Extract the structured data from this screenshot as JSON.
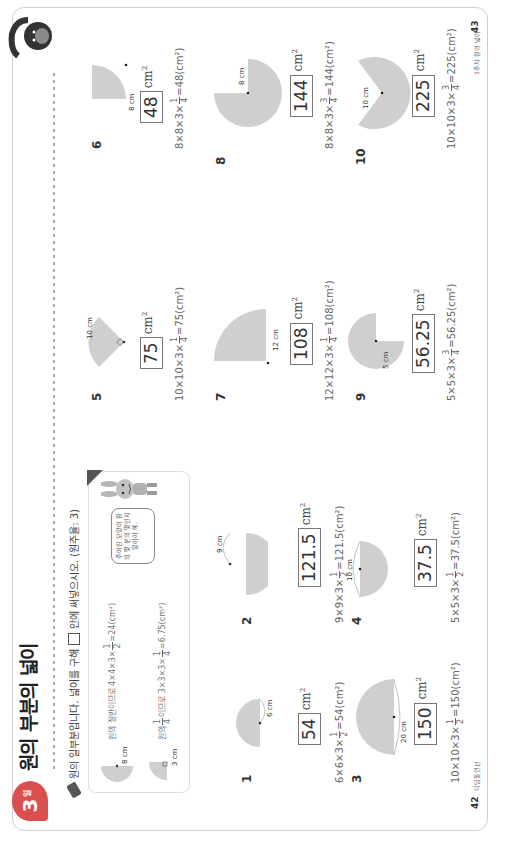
{
  "header": {
    "badge_number": "3",
    "badge_suffix": "일",
    "title": "원의 부분의 넓이",
    "instruction": "원의 일부분입니다. 넓이를 구해",
    "instruction_tail": "안에 써넣으시오. (원주율: 3)"
  },
  "example": {
    "line1": "원의 절반이므로 4×4×3×",
    "line1_frac": {
      "num": "1",
      "den": "2"
    },
    "line1_result": "=24(cm²)",
    "line1_label": "8 cm",
    "line2_prefix": "원의",
    "line2_frac_a": {
      "num": "1",
      "den": "4"
    },
    "line2_mid": "이므로 3×3×3×",
    "line2_frac_b": {
      "num": "1",
      "den": "4"
    },
    "line2_result": "=6.75(cm²)",
    "line2_label": "3 cm",
    "bubble": "주어진 모양이 원의 몇 분의 몇인지 알아야 해."
  },
  "problems": [
    {
      "number": "1",
      "label": "6 cm",
      "answer": "54",
      "unit": "cm",
      "calc_prefix": "6×6×3×",
      "frac": {
        "num": "1",
        "den": "2"
      },
      "calc_result": "=54(cm²)"
    },
    {
      "number": "2",
      "label": "9 cm",
      "answer": "121.5",
      "unit": "cm",
      "calc_prefix": "9×9×3×",
      "frac": {
        "num": "1",
        "den": "2"
      },
      "calc_result": "=121.5(cm²)"
    },
    {
      "number": "3",
      "label": "20 cm",
      "answer": "150",
      "unit": "cm",
      "calc_prefix": "10×10×3×",
      "frac": {
        "num": "1",
        "den": "2"
      },
      "calc_result": "=150(cm²)"
    },
    {
      "number": "4",
      "label": "10 cm",
      "answer": "37.5",
      "unit": "cm",
      "calc_prefix": "5×5×3×",
      "frac": {
        "num": "1",
        "den": "2"
      },
      "calc_result": "=37.5(cm²)"
    },
    {
      "number": "5",
      "label": "10 cm",
      "answer": "75",
      "unit": "cm",
      "calc_prefix": "10×10×3×",
      "frac": {
        "num": "1",
        "den": "4"
      },
      "calc_result": "=75(cm²)"
    },
    {
      "number": "6",
      "label": "8 cm",
      "answer": "48",
      "unit": "cm",
      "calc_prefix": "8×8×3×",
      "frac": {
        "num": "1",
        "den": "4"
      },
      "calc_result": "=48(cm²)"
    },
    {
      "number": "7",
      "label": "12 cm",
      "answer": "108",
      "unit": "cm",
      "calc_prefix": "12×12×3×",
      "frac": {
        "num": "1",
        "den": "4"
      },
      "calc_result": "=108(cm²)"
    },
    {
      "number": "8",
      "label": "8 cm",
      "answer": "144",
      "unit": "cm",
      "calc_prefix": "8×8×3×",
      "frac": {
        "num": "3",
        "den": "4"
      },
      "calc_result": "=144(cm²)"
    },
    {
      "number": "9",
      "label": "5 cm",
      "answer": "56.25",
      "unit": "cm",
      "calc_prefix": "5×5×3×",
      "frac": {
        "num": "3",
        "den": "4"
      },
      "calc_result": "=56.25(cm²)"
    },
    {
      "number": "10",
      "label": "10 cm",
      "answer": "225",
      "unit": "cm",
      "calc_prefix": "10×10×3×",
      "frac": {
        "num": "3",
        "den": "4"
      },
      "calc_result": "=225(cm²)"
    }
  ],
  "footer": {
    "left_page": "42",
    "left_label": "디딤돌연산",
    "right_page": "43",
    "right_label": "3주차 원의 넓이"
  },
  "colors": {
    "shape_fill": "#cfcfcf",
    "badge": "#d9504f"
  }
}
